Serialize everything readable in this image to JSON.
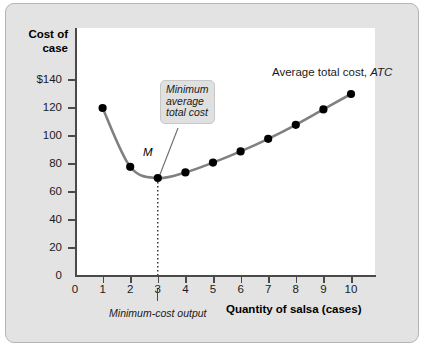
{
  "chart_data": {
    "type": "line",
    "title": "",
    "xlabel": "Quantity of salsa (cases)",
    "ylabel": "Cost of case",
    "ylabel_line1": "Cost of",
    "ylabel_line2": "case",
    "x": [
      1,
      2,
      3,
      4,
      5,
      6,
      7,
      8,
      9,
      10
    ],
    "xticklabels": [
      "0",
      "1",
      "2",
      "3",
      "4",
      "5",
      "6",
      "7",
      "8",
      "9",
      "10"
    ],
    "yticklabels": [
      "$140",
      "120",
      "100",
      "80",
      "60",
      "40",
      "20",
      "0"
    ],
    "ytickvalues": [
      140,
      120,
      100,
      80,
      60,
      40,
      20,
      0
    ],
    "xlim": [
      0,
      10.6
    ],
    "ylim": [
      0,
      150
    ],
    "grid": false,
    "legend_position": "inside-upper-right",
    "series": [
      {
        "name": "Average total cost, ATC",
        "name_plain": "Average total cost,",
        "name_italic": "ATC",
        "values": [
          120,
          78,
          70,
          74,
          81,
          89,
          98,
          108,
          119,
          130
        ],
        "color": "#808080",
        "marker": "circle",
        "marker_color": "#000000"
      }
    ],
    "annotations": [
      {
        "name": "minimum-average-total-cost-callout",
        "line1": "Minimum",
        "line2": "average",
        "line3": "total cost",
        "points_to_x": 3,
        "points_to_y": 70
      },
      {
        "name": "point-m-label",
        "text": "M",
        "at_x": 3,
        "at_y": 70
      },
      {
        "name": "minimum-cost-output-label",
        "text": "Minimum-cost output",
        "at_x": 3
      }
    ],
    "dropline": {
      "from_x": 3,
      "from_y": 70,
      "to_y": 0,
      "style": "dotted"
    }
  },
  "colors": {
    "curve": "#808080",
    "marker": "#000000",
    "axis": "#4a4a4a",
    "frame_background": "#e3e3e3",
    "frame_border": "#b4b4b4",
    "plot_background": "#ffffff",
    "callout_background": "#e0e0e0"
  }
}
